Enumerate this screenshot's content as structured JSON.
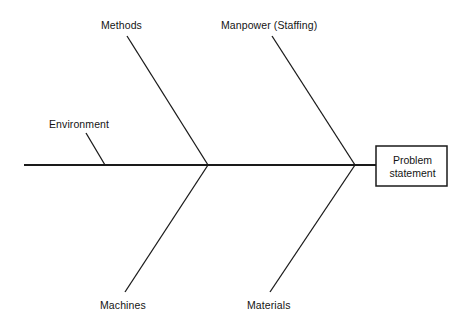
{
  "diagram": {
    "type": "fishbone-ishikawa-cause-and-effect",
    "spine": {
      "start_x": 24,
      "end_x": 376,
      "y": 165
    },
    "effect_box": {
      "name": "problem-statement-box",
      "line1": "Problem",
      "line2": "statement",
      "x": 376,
      "y": 146,
      "width": 71,
      "height": 40
    },
    "categories": [
      {
        "id": "environment",
        "label": "Environment",
        "position": "upper-left",
        "label_x": 49,
        "label_y": 118,
        "bone": {
          "x1": 86,
          "y1": 133,
          "x2": 105,
          "y2": 165
        }
      },
      {
        "id": "methods",
        "label": "Methods",
        "position": "upper-left-mid",
        "label_x": 101,
        "label_y": 19,
        "bone": {
          "x1": 127,
          "y1": 36,
          "x2": 208,
          "y2": 165
        }
      },
      {
        "id": "manpower",
        "label": "Manpower (Staffing)",
        "position": "upper-right",
        "label_x": 221,
        "label_y": 19,
        "bone": {
          "x1": 272,
          "y1": 36,
          "x2": 355,
          "y2": 165
        }
      },
      {
        "id": "machines",
        "label": "Machines",
        "position": "lower-left",
        "label_x": 100,
        "label_y": 299,
        "bone": {
          "x1": 125,
          "y1": 292,
          "x2": 208,
          "y2": 165
        }
      },
      {
        "id": "materials",
        "label": "Materials",
        "position": "lower-right",
        "label_x": 247,
        "label_y": 299,
        "bone": {
          "x1": 270,
          "y1": 292,
          "x2": 355,
          "y2": 165
        }
      }
    ],
    "colors": {
      "line": "#1a1a1a",
      "text": "#141414",
      "background": "#ffffff"
    }
  }
}
